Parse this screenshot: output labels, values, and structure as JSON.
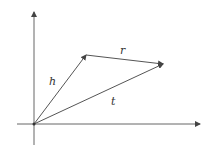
{
  "diagram": {
    "type": "vector-triangle",
    "colors": {
      "line": "#555555",
      "axis": "#666666",
      "text": "#333333"
    },
    "axes": {
      "origin": [
        34,
        124
      ],
      "x_axis": {
        "from": [
          17,
          124
        ],
        "to": [
          200,
          124
        ]
      },
      "y_axis": {
        "from": [
          34,
          145
        ],
        "to": [
          34,
          12
        ]
      }
    },
    "vectors": [
      {
        "name": "h",
        "from": [
          34,
          124
        ],
        "to": [
          86,
          55
        ],
        "label": "h",
        "label_pos": [
          50,
          84
        ]
      },
      {
        "name": "r",
        "from": [
          86,
          55
        ],
        "to": [
          163,
          64
        ],
        "label": "r",
        "label_pos": [
          121,
          53
        ]
      },
      {
        "name": "t",
        "from": [
          34,
          124
        ],
        "to": [
          163,
          64
        ],
        "label": "t",
        "label_pos": [
          111,
          104
        ]
      }
    ]
  },
  "labels": {
    "h": "h",
    "r": "r",
    "t": "t"
  }
}
